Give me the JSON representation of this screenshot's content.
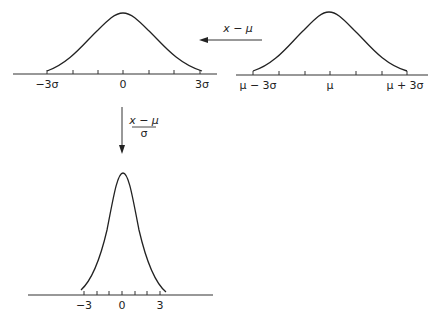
{
  "diagram": {
    "panels": {
      "original": {
        "tick_labels": [
          "μ − 3σ",
          "μ",
          "μ + 3σ"
        ],
        "tick_count": 7
      },
      "centered": {
        "tick_labels": [
          "−3σ",
          "0",
          "3σ"
        ],
        "tick_count": 7
      },
      "standardized": {
        "tick_labels": [
          "−3",
          "0",
          "3"
        ],
        "tick_count": 7
      }
    },
    "transforms": {
      "shift": {
        "label": "x − μ",
        "direction": "left"
      },
      "scale": {
        "numerator": "x − μ",
        "denominator": "σ",
        "direction": "down"
      }
    }
  },
  "colors": {
    "line": "#222222",
    "background": "#ffffff",
    "axis": "#333333"
  }
}
